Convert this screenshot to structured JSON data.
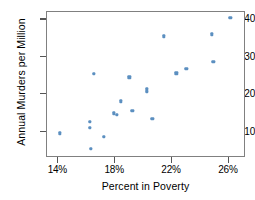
{
  "chart_data": {
    "type": "scatter",
    "title": "",
    "xlabel": "Percent in Poverty",
    "ylabel": "Annual Murders per Million",
    "xlim": [
      13.2,
      27.2
    ],
    "ylim": [
      3.0,
      42.0
    ],
    "xticks": [
      14,
      18,
      22,
      26
    ],
    "xticklabels": [
      "14%",
      "18%",
      "22%",
      "26%"
    ],
    "yticks": [
      10,
      20,
      30,
      40
    ],
    "yticklabels": [
      "10",
      "20",
      "30",
      "40"
    ],
    "grid": false,
    "legend": null,
    "marker_color": "#5b8fc0",
    "frame_color": "#808080",
    "points": [
      {
        "x": 14.1,
        "y": 9.6
      },
      {
        "x": 16.2,
        "y": 12.6
      },
      {
        "x": 16.2,
        "y": 11.1
      },
      {
        "x": 16.3,
        "y": 5.4
      },
      {
        "x": 16.5,
        "y": 25.5
      },
      {
        "x": 17.2,
        "y": 8.7
      },
      {
        "x": 17.9,
        "y": 14.9
      },
      {
        "x": 18.1,
        "y": 14.5
      },
      {
        "x": 18.4,
        "y": 18.1
      },
      {
        "x": 19.0,
        "y": 24.6
      },
      {
        "x": 19.2,
        "y": 15.6
      },
      {
        "x": 20.2,
        "y": 21.3
      },
      {
        "x": 20.2,
        "y": 20.7
      },
      {
        "x": 20.6,
        "y": 13.4
      },
      {
        "x": 21.4,
        "y": 35.5
      },
      {
        "x": 22.3,
        "y": 25.6
      },
      {
        "x": 23.0,
        "y": 26.8
      },
      {
        "x": 24.8,
        "y": 36.0
      },
      {
        "x": 24.9,
        "y": 28.7
      },
      {
        "x": 26.1,
        "y": 40.5
      }
    ]
  }
}
